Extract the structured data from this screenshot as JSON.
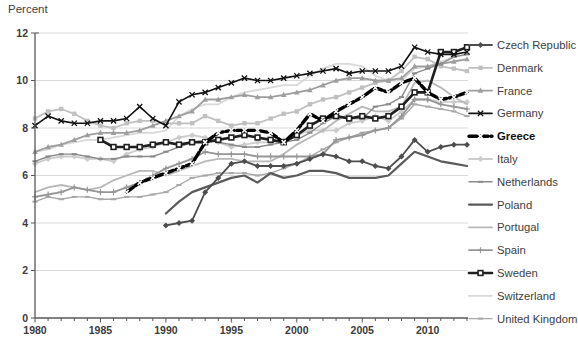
{
  "chart_data": {
    "type": "line",
    "title": "",
    "ylabel": "Percent",
    "xlabel": "",
    "ylim": [
      0,
      12
    ],
    "yticks": [
      0,
      2,
      4,
      6,
      8,
      10,
      12
    ],
    "xlim": [
      1980,
      2013
    ],
    "xtick_labels": [
      1980,
      1985,
      1990,
      1995,
      2000,
      2005,
      2010
    ],
    "grid": "horizontal",
    "gridline_color": "#d9d9d9",
    "axis_color": "#595959",
    "legend_position": "right",
    "x": [
      1980,
      1981,
      1982,
      1983,
      1984,
      1985,
      1986,
      1987,
      1988,
      1989,
      1990,
      1991,
      1992,
      1993,
      1994,
      1995,
      1996,
      1997,
      1998,
      1999,
      2000,
      2001,
      2002,
      2003,
      2004,
      2005,
      2006,
      2007,
      2008,
      2009,
      2010,
      2011,
      2012,
      2013
    ],
    "series": [
      {
        "name": "Czech Republic",
        "color": "#4d4d4d",
        "marker": "diamond",
        "line_width": 1.8,
        "dash": "",
        "emphasis": false,
        "values": [
          null,
          null,
          null,
          null,
          null,
          null,
          null,
          null,
          null,
          null,
          3.9,
          4.0,
          4.1,
          5.3,
          5.9,
          6.5,
          6.6,
          6.4,
          6.4,
          6.4,
          6.5,
          6.7,
          6.9,
          6.8,
          6.6,
          6.6,
          6.4,
          6.3,
          6.8,
          7.5,
          7.0,
          7.2,
          7.3,
          7.3
        ]
      },
      {
        "name": "Denmark",
        "color": "#c0c0c0",
        "marker": "square",
        "line_width": 1.8,
        "dash": "",
        "emphasis": false,
        "values": [
          8.4,
          8.7,
          8.8,
          8.6,
          8.3,
          8.1,
          8.0,
          8.2,
          8.3,
          8.3,
          8.2,
          8.2,
          8.2,
          8.5,
          8.3,
          8.1,
          8.2,
          8.2,
          8.4,
          8.6,
          8.7,
          9.0,
          9.2,
          9.3,
          9.5,
          9.7,
          9.9,
          10.0,
          10.4,
          11.0,
          10.9,
          10.6,
          10.5,
          10.4
        ]
      },
      {
        "name": "France",
        "color": "#9e9e9e",
        "marker": "triangle",
        "line_width": 1.8,
        "dash": "",
        "emphasis": false,
        "values": [
          7.0,
          7.2,
          7.3,
          7.5,
          7.7,
          7.8,
          7.8,
          7.8,
          7.9,
          8.1,
          8.3,
          8.5,
          8.7,
          9.2,
          9.2,
          9.3,
          9.4,
          9.3,
          9.3,
          9.4,
          9.5,
          9.6,
          9.8,
          10.0,
          10.1,
          10.1,
          10.0,
          10.0,
          10.1,
          10.6,
          10.6,
          10.7,
          10.8,
          10.9
        ]
      },
      {
        "name": "Germany",
        "color": "#111111",
        "marker": "x",
        "line_width": 1.6,
        "dash": "",
        "emphasis": false,
        "values": [
          8.1,
          8.5,
          8.3,
          8.2,
          8.2,
          8.3,
          8.3,
          8.4,
          8.9,
          8.4,
          8.1,
          9.1,
          9.4,
          9.5,
          9.7,
          9.9,
          10.1,
          10.0,
          10.0,
          10.1,
          10.2,
          10.3,
          10.4,
          10.5,
          10.3,
          10.4,
          10.4,
          10.4,
          10.6,
          11.4,
          11.2,
          11.1,
          11.1,
          11.2
        ]
      },
      {
        "name": "Greece",
        "color": "#000000",
        "marker": "x-white",
        "line_width": 3.4,
        "dash": "8,3",
        "emphasis": true,
        "values": [
          null,
          null,
          null,
          null,
          null,
          null,
          null,
          5.3,
          5.7,
          5.9,
          6.1,
          6.3,
          6.5,
          7.4,
          7.8,
          7.9,
          7.9,
          7.9,
          7.8,
          7.4,
          7.9,
          8.6,
          8.3,
          8.7,
          9.0,
          9.3,
          9.7,
          9.5,
          9.9,
          10.1,
          9.5,
          9.2,
          9.3,
          9.5
        ]
      },
      {
        "name": "Italy",
        "color": "#cccccc",
        "marker": "diamond",
        "line_width": 1.8,
        "dash": "",
        "emphasis": false,
        "values": [
          6.5,
          6.7,
          6.8,
          6.8,
          6.7,
          6.7,
          6.6,
          6.9,
          7.1,
          7.2,
          7.4,
          7.6,
          7.7,
          7.6,
          7.4,
          7.2,
          7.3,
          7.4,
          7.4,
          7.5,
          7.7,
          7.9,
          7.9,
          7.9,
          8.2,
          8.3,
          8.5,
          8.3,
          8.7,
          9.2,
          9.2,
          9.1,
          9.1,
          9.1
        ]
      },
      {
        "name": "Netherlands",
        "color": "#8a8a8a",
        "marker": "dash",
        "line_width": 1.4,
        "dash": "",
        "emphasis": false,
        "values": [
          6.6,
          6.8,
          6.9,
          6.9,
          6.8,
          6.7,
          6.7,
          6.8,
          6.8,
          6.8,
          7.0,
          7.2,
          7.4,
          7.5,
          7.4,
          7.3,
          7.2,
          7.2,
          7.3,
          7.4,
          7.5,
          7.8,
          8.2,
          8.5,
          8.4,
          8.4,
          8.9,
          9.0,
          9.3,
          10.3,
          10.5,
          10.7,
          11.0,
          11.1
        ]
      },
      {
        "name": "Poland",
        "color": "#5a5a5a",
        "marker": "none",
        "line_width": 2.2,
        "dash": "",
        "emphasis": false,
        "values": [
          null,
          null,
          null,
          null,
          null,
          null,
          null,
          null,
          null,
          null,
          4.4,
          4.9,
          5.3,
          5.5,
          5.7,
          5.9,
          6.0,
          5.7,
          6.1,
          5.9,
          6.0,
          6.2,
          6.2,
          6.1,
          5.9,
          5.9,
          5.9,
          6.0,
          6.5,
          7.0,
          6.8,
          6.6,
          6.5,
          6.4
        ]
      },
      {
        "name": "Portugal",
        "color": "#b8b8b8",
        "marker": "none",
        "line_width": 1.8,
        "dash": "",
        "emphasis": false,
        "values": [
          5.3,
          5.5,
          5.6,
          5.5,
          5.4,
          5.5,
          5.8,
          6.0,
          6.2,
          6.2,
          6.0,
          6.2,
          6.4,
          6.6,
          6.7,
          6.7,
          6.6,
          6.6,
          6.6,
          6.9,
          7.3,
          7.6,
          7.9,
          8.3,
          8.6,
          8.9,
          8.7,
          8.7,
          8.9,
          9.9,
          10.0,
          9.7,
          9.3,
          9.0
        ]
      },
      {
        "name": "Spain",
        "color": "#969696",
        "marker": "plus",
        "line_width": 1.8,
        "dash": "",
        "emphasis": false,
        "values": [
          5.1,
          5.2,
          5.3,
          5.5,
          5.4,
          5.3,
          5.3,
          5.5,
          5.7,
          6.0,
          6.3,
          6.5,
          6.7,
          7.0,
          6.9,
          6.9,
          6.9,
          6.8,
          6.8,
          6.8,
          6.8,
          6.8,
          6.9,
          7.5,
          7.6,
          7.7,
          7.9,
          8.0,
          8.5,
          9.2,
          9.2,
          9.0,
          8.9,
          8.8
        ]
      },
      {
        "name": "Sweden",
        "color": "#1f1f1f",
        "marker": "square-open",
        "line_width": 2.6,
        "dash": "",
        "emphasis": false,
        "values": [
          null,
          null,
          null,
          null,
          null,
          7.5,
          7.2,
          7.2,
          7.2,
          7.3,
          7.4,
          7.3,
          7.4,
          7.4,
          7.5,
          7.6,
          7.7,
          7.6,
          7.5,
          7.4,
          7.7,
          8.1,
          8.4,
          8.5,
          8.4,
          8.5,
          8.4,
          8.5,
          8.9,
          9.5,
          9.5,
          11.2,
          11.2,
          11.4
        ]
      },
      {
        "name": "Switzerland",
        "color": "#d8d8d8",
        "marker": "none",
        "line_width": 1.8,
        "dash": "",
        "emphasis": false,
        "values": [
          7.0,
          7.1,
          7.3,
          7.4,
          7.5,
          7.5,
          7.6,
          7.7,
          7.8,
          7.8,
          7.9,
          8.5,
          8.8,
          9.0,
          9.0,
          9.3,
          9.5,
          9.6,
          9.7,
          9.8,
          9.8,
          10.2,
          10.5,
          10.7,
          10.7,
          10.6,
          10.2,
          10.0,
          10.0,
          10.5,
          10.6,
          10.8,
          11.0,
          11.1
        ]
      },
      {
        "name": "United Kingdom",
        "color": "#a8a8a8",
        "marker": "dash",
        "line_width": 1.4,
        "dash": "",
        "emphasis": false,
        "values": [
          4.9,
          5.1,
          5.0,
          5.1,
          5.1,
          5.0,
          5.0,
          5.1,
          5.1,
          5.2,
          5.3,
          5.6,
          5.9,
          6.0,
          6.1,
          6.1,
          6.1,
          6.0,
          6.1,
          6.3,
          6.5,
          6.8,
          7.1,
          7.4,
          7.6,
          7.8,
          7.9,
          8.0,
          8.4,
          9.0,
          8.9,
          8.8,
          8.7,
          8.5
        ]
      }
    ]
  }
}
